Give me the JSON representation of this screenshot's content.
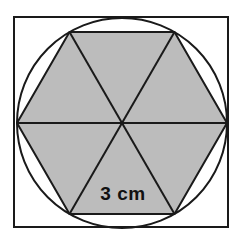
{
  "figure": {
    "background_color": "#ffffff",
    "stroke_color": "#1a1a1a",
    "shaded_fill_color": "#bcbcbc",
    "unshaded_fill_color": "#ffffff",
    "square": {
      "name": "outer-square",
      "x": 14,
      "y": 17,
      "width": 214,
      "height": 210,
      "stroke_width": 2,
      "fill": "none"
    },
    "circle": {
      "name": "inscribed-circle",
      "cx": 122,
      "cy": 123,
      "r": 105,
      "stroke_width": 2,
      "fill": "none"
    },
    "hexagon": {
      "name": "inscribed-hexagon",
      "center_x": 122,
      "center_y": 123,
      "circumradius": 105,
      "sides": 6,
      "stroke_width": 2,
      "fill": "#bcbcbc",
      "vertices": [
        {
          "label": "right",
          "x": 227,
          "y": 123
        },
        {
          "label": "top-right",
          "x": 174.5,
          "y": 32.1
        },
        {
          "label": "top-left",
          "x": 69.5,
          "y": 32.1
        },
        {
          "label": "left",
          "x": 17,
          "y": 123
        },
        {
          "label": "bottom-left",
          "x": 69.5,
          "y": 213.9
        },
        {
          "label": "bottom-right",
          "x": 174.5,
          "y": 213.9
        }
      ]
    },
    "radii": {
      "name": "hexagon-center-diagonals",
      "count": 6,
      "stroke_width": 2,
      "description": "Six segments from hexagon center to each vertex, dividing the hexagon into six equilateral triangles"
    },
    "triangles_count": 6,
    "label": {
      "name": "side-length-label",
      "text": "3 cm",
      "x": 123,
      "y": 200,
      "font_size": 19,
      "font_weight": "bold",
      "color": "#111111",
      "refers_to": "hexagon-bottom-side"
    }
  }
}
